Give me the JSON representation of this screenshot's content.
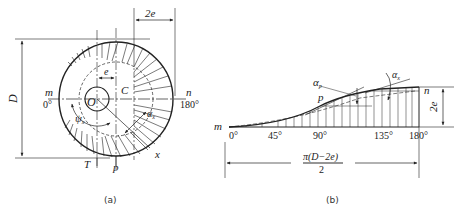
{
  "figure_a": {
    "caption": "(a)",
    "labels": {
      "diameter": "D",
      "offset_2e": "2e",
      "offset_e": "e",
      "center_O": "O",
      "point_C": "C",
      "point_m": "m",
      "angle_0": "0°",
      "point_n": "n",
      "angle_180": "180°",
      "angle_psi": "ψ",
      "angle_psi_sub": "x",
      "alpha_x": "α",
      "alpha_x_sub": "x",
      "point_T": "T",
      "point_p": "p",
      "point_x": "x"
    }
  },
  "figure_b": {
    "caption": "(b)",
    "labels": {
      "point_m": "m",
      "point_n": "n",
      "point_p": "p",
      "alpha_p": "α",
      "alpha_p_sub": "p",
      "alpha_x": "α",
      "alpha_x_sub": "x",
      "rise": "2e",
      "length_num": "π(D−2e)",
      "length_den": "2"
    },
    "ticks": [
      "0°",
      "45°",
      "90°",
      "135°",
      "180°"
    ]
  }
}
